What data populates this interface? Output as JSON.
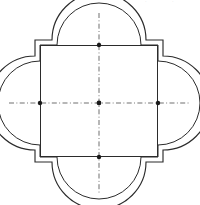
{
  "document": {
    "type": "scanned-line-drawing",
    "title": "Quatrefoil plan",
    "background_color": "#ffffff",
    "ink_color": "#2b2b2b",
    "centerline_color": "#555555",
    "faint_mark_color": "#b9b9b9"
  },
  "scan_artifacts": {
    "description": "Faint cropped marks along the top edge of the scan",
    "marks": [
      {
        "id": "mark-left",
        "text": "·"
      },
      {
        "id": "mark-right",
        "text": "·"
      }
    ]
  },
  "drawing": {
    "name": "quatrefoil-floor-plan",
    "view_box": "0 0 200 205",
    "center": {
      "x": 99,
      "y": 103
    },
    "extents": {
      "left": 6,
      "right": 192,
      "top": 9,
      "bottom": 197
    },
    "square": {
      "name": "central-square",
      "outer": {
        "x": 35,
        "y": 40,
        "width": 128,
        "height": 122
      },
      "inner": {
        "x": 40,
        "y": 45,
        "width": 118,
        "height": 112
      },
      "fill": "#ffffff",
      "stroke": "#2b2b2b",
      "stroke_width": 1
    },
    "lobes": [
      {
        "name": "lobe-north",
        "orientation": "north",
        "outer_radius": 47,
        "inner_radius": 42
      },
      {
        "name": "lobe-east",
        "orientation": "east",
        "outer_radius": 47,
        "inner_radius": 42
      },
      {
        "name": "lobe-south",
        "orientation": "south",
        "outer_radius": 47,
        "inner_radius": 42
      },
      {
        "name": "lobe-west",
        "orientation": "west",
        "outer_radius": 47,
        "inner_radius": 42
      }
    ],
    "centerlines": [
      {
        "name": "centerline-horizontal",
        "orientation": "horizontal",
        "from": {
          "x": 9,
          "y": 103
        },
        "to": {
          "x": 189,
          "y": 103
        },
        "style": "dash-dot"
      },
      {
        "name": "centerline-vertical",
        "orientation": "vertical",
        "from": {
          "x": 99,
          "y": 13
        },
        "to": {
          "x": 99,
          "y": 193
        },
        "style": "dash-dot"
      }
    ],
    "nodes": [
      {
        "name": "node-center",
        "x": 99,
        "y": 103,
        "radius": 2.4
      },
      {
        "name": "node-north",
        "x": 99,
        "y": 45,
        "radius": 2.2
      },
      {
        "name": "node-east",
        "x": 158,
        "y": 103,
        "radius": 2.2
      },
      {
        "name": "node-south",
        "x": 99,
        "y": 157,
        "radius": 2.2
      },
      {
        "name": "node-west",
        "x": 40,
        "y": 103,
        "radius": 2.2
      }
    ]
  }
}
